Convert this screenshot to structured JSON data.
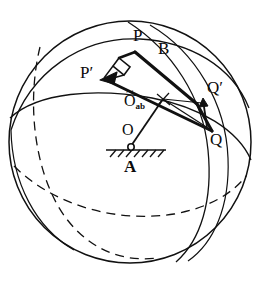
{
  "figure": {
    "type": "geometric-diagram",
    "background_color": "#ffffff",
    "stroke_color": "#111111",
    "labels": {
      "p": "P",
      "p_prime": "P′",
      "b": "B",
      "q": "Q",
      "q_prime": "Q′",
      "o": "O",
      "a": "A",
      "o_ab_base": "O",
      "o_ab_tilde": "~",
      "o_ab_sub": "ab"
    },
    "geometry": {
      "sphere": {
        "cx": 130,
        "cy": 142,
        "r": 121
      },
      "points": {
        "P": {
          "x": 137,
          "y": 50
        },
        "P_prime": {
          "x": 102,
          "y": 79
        },
        "Q": {
          "x": 213,
          "y": 133
        },
        "Q_prime": {
          "x": 216,
          "y": 104
        },
        "O": {
          "x": 131,
          "y": 147
        },
        "O_ab": {
          "x": 162,
          "y": 99
        }
      },
      "solid_arcs": 4,
      "dashed_arcs": 2,
      "right_angle_marker": true,
      "support_hatch_count": 7
    }
  }
}
